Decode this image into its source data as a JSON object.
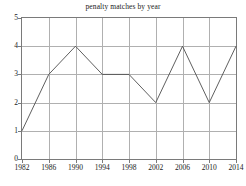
{
  "chart_data": {
    "type": "line",
    "title": "penalty matches by year",
    "xlabel": "",
    "ylabel": "",
    "x": [
      1982,
      1986,
      1990,
      1994,
      1998,
      2002,
      2006,
      2010,
      2014
    ],
    "values": [
      1,
      3,
      4,
      3,
      3,
      2,
      4,
      2,
      4
    ],
    "xtick_labels": [
      "1982",
      "1986",
      "1990",
      "1994",
      "1998",
      "2002",
      "2006",
      "2010",
      "2014"
    ],
    "ytick_labels": [
      "0",
      "1",
      "2",
      "3",
      "4",
      "5"
    ],
    "yticks": [
      0,
      1,
      2,
      3,
      4,
      5
    ],
    "xlim": [
      1982,
      2014
    ],
    "ylim": [
      0,
      5
    ],
    "grid": true,
    "legend": null,
    "marker": "none",
    "colors": {
      "line": "#4d4d4d",
      "grid": "#b0b0b0",
      "axis": "#7a7a7a",
      "text": "#1a1a1a",
      "background": "#ffffff"
    }
  }
}
